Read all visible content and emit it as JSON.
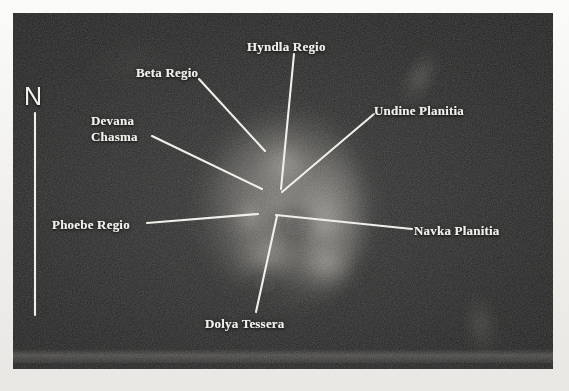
{
  "figure": {
    "plate_background_color": "#232323",
    "annotation_color": "#f0efe9",
    "page_background_color": "#f2f1ef"
  },
  "compass": {
    "label": "N",
    "direction": "north",
    "x": 24,
    "y": 84,
    "line_x": 35,
    "line_top": 113,
    "line_bottom": 315
  },
  "labels": [
    {
      "id": "beta-regio",
      "name": "Beta Regio",
      "text": "Beta Regio",
      "x": 136,
      "y": 66,
      "align": "left",
      "lines": 1
    },
    {
      "id": "hyndla-regio",
      "name": "Hyndla Regio",
      "text": "Hyndla Regio",
      "x": 247,
      "y": 40,
      "align": "left",
      "lines": 1
    },
    {
      "id": "undine-planitia",
      "name": "Undine Planitia",
      "text": "Undine Planitia",
      "x": 374,
      "y": 104,
      "align": "left",
      "lines": 1
    },
    {
      "id": "devana-chasma",
      "name": "Devana Chasma",
      "text": "Devana\nChasma",
      "x": 91,
      "y": 113,
      "align": "left",
      "lines": 2
    },
    {
      "id": "phoebe-regio",
      "name": "Phoebe Regio",
      "text": "Phoebe Regio",
      "x": 52,
      "y": 218,
      "align": "left",
      "lines": 1
    },
    {
      "id": "navka-planitia",
      "name": "Navka Planitia",
      "text": "Navka Planitia",
      "x": 414,
      "y": 224,
      "align": "left",
      "lines": 1
    },
    {
      "id": "dolya-tessera",
      "name": "Dolya Tessera",
      "text": "Dolya Tessera",
      "x": 205,
      "y": 317,
      "align": "left",
      "lines": 1
    }
  ],
  "leader_lines": [
    {
      "id": "leader-beta-regio",
      "from": [
        199,
        79
      ],
      "to": [
        265,
        151
      ]
    },
    {
      "id": "leader-hyndla-regio",
      "from": [
        294,
        54
      ],
      "to": [
        281,
        189
      ]
    },
    {
      "id": "leader-undine-planitia",
      "from": [
        374,
        114
      ],
      "to": [
        282,
        192
      ]
    },
    {
      "id": "leader-devana-chasma",
      "from": [
        152,
        136
      ],
      "to": [
        262,
        189
      ]
    },
    {
      "id": "leader-phoebe-regio",
      "from": [
        147,
        223
      ],
      "to": [
        258,
        214
      ]
    },
    {
      "id": "leader-navka-planitia",
      "from": [
        412,
        229
      ],
      "to": [
        276,
        215
      ]
    },
    {
      "id": "leader-dolya-tessera",
      "from": [
        256,
        312
      ],
      "to": [
        277,
        216
      ]
    }
  ],
  "venus_features": [
    {
      "id": "main-bright-region",
      "description": "central bright highland mass"
    },
    {
      "id": "northeast-streak",
      "description": "faint diagonal bright streak, upper right"
    },
    {
      "id": "southeast-patch",
      "description": "faint diffuse bright patch, lower right"
    }
  ]
}
